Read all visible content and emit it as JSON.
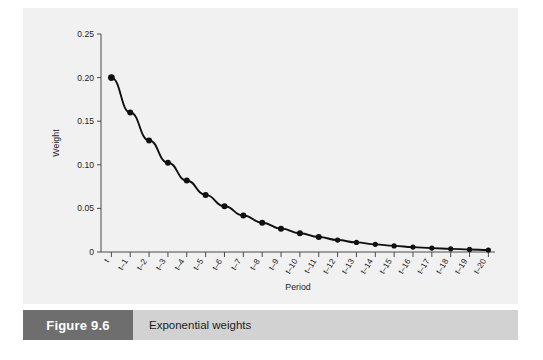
{
  "figure": {
    "number_label": "Figure 9.6",
    "caption": "Exponential weights",
    "number_box_color": "#6e6e6e",
    "caption_bar_color": "#d2d2d2",
    "panel_color": "#f1f1f1"
  },
  "chart_data": {
    "type": "line",
    "title": "",
    "xlabel": "Period",
    "ylabel": "Weight",
    "ylim": [
      0,
      0.25
    ],
    "yticks": [
      0,
      0.05,
      0.1,
      0.15,
      0.2,
      0.25
    ],
    "ytick_labels": [
      "0",
      "0.05",
      "0.10",
      "0.15",
      "0.20",
      "0.25"
    ],
    "grid": false,
    "legend": null,
    "marker": "filled-circle",
    "series_color": "#101010",
    "categories": [
      "t",
      "t–1",
      "t–2",
      "t–3",
      "t–4",
      "t–5",
      "t–6",
      "t–7",
      "t–8",
      "t–9",
      "t–10",
      "t–11",
      "t–12",
      "t–13",
      "t–14",
      "t–15",
      "t–16",
      "t–17",
      "t–18",
      "t–19",
      "t–20"
    ],
    "values": [
      0.2,
      0.16,
      0.128,
      0.1024,
      0.0819,
      0.0655,
      0.0524,
      0.0419,
      0.0336,
      0.0268,
      0.0215,
      0.0172,
      0.0137,
      0.011,
      0.0088,
      0.007,
      0.0056,
      0.0045,
      0.0036,
      0.0029,
      0.0023
    ]
  }
}
